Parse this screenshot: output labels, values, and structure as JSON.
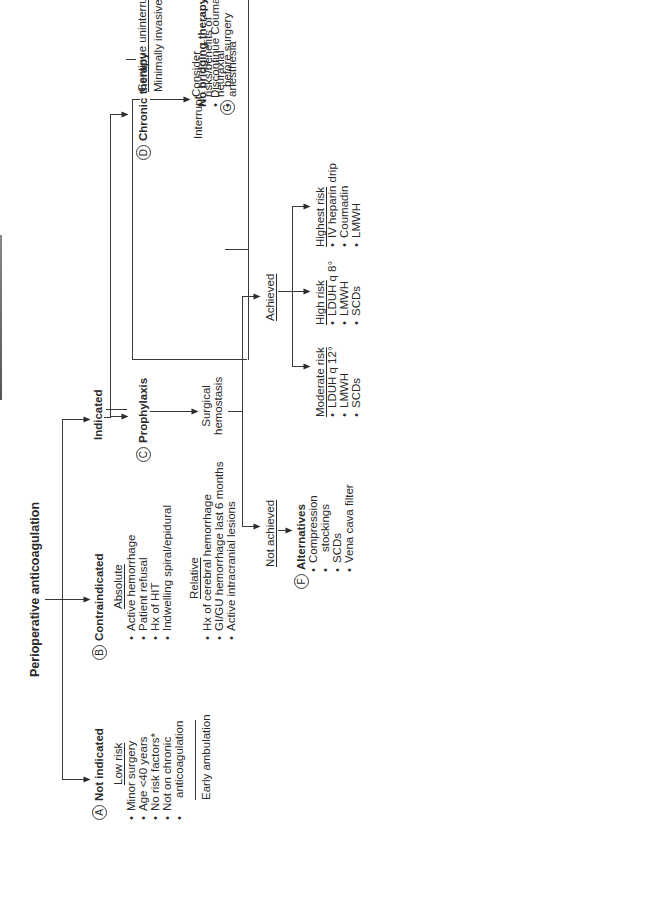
{
  "title": "Perioperative anticoagulation",
  "branches": {
    "not_indicated": {
      "marker": "A",
      "label": "Not indicated",
      "subheading": "Low risk",
      "items": [
        "Minor surgery",
        "Age <40 years",
        "No risk factors*",
        "Not on chronic",
        "anticoagulation"
      ],
      "footer": "Early ambulation"
    },
    "contraindicated": {
      "marker": "B",
      "label": "Contraindicated",
      "absolute": {
        "heading": "Absolute",
        "items": [
          "Active hemorrhage",
          "Patient refusal",
          "Hx of HIT",
          "Indwelling spiral/epidural"
        ]
      },
      "relative": {
        "heading": "Relative",
        "items": [
          "Hx of cerebral hemorrhage",
          "GI/GU hemorrhage last 6 months",
          "Active intracranial lesions"
        ]
      }
    },
    "indicated": {
      "label": "Indicated",
      "prophylaxis": {
        "marker": "C",
        "label": "Prophylaxis",
        "hemostasis_label_1": "Surgical",
        "hemostasis_label_2": "hemostasis",
        "not_achieved": {
          "label": "Not achieved",
          "alternatives": {
            "marker": "F",
            "label": "Alternatives",
            "items": [
              "Compression",
              "stockings",
              "SCDs",
              "Vena cava filter"
            ]
          }
        },
        "achieved": {
          "label": "Achieved",
          "risk_groups": [
            {
              "heading": "Moderate risk",
              "items": [
                "LDUH q 12°",
                "LMWH",
                "SCDs"
              ]
            },
            {
              "heading": "High risk",
              "items": [
                "LDUH q 8°",
                "LMWH",
                "SCDs"
              ]
            },
            {
              "heading": "Highest risk",
              "items": [
                "IV heparin drip",
                "Coumadin",
                "LMWH"
              ]
            }
          ]
        }
      },
      "chronic": {
        "marker": "D",
        "label": "Chronic therapy",
        "continue_label": "Continue uninterrupted",
        "continue_sub": "Minimally invasive procedures",
        "interrupt_label": "Interrupt",
        "no_bridging": {
          "label": "No bridging therapy",
          "items": [
            "Discontinue Coumadin 5 days",
            "before surgery"
          ]
        },
        "bridging": {
          "marker": "E",
          "label": "Bridging therapy",
          "items": [
            "Stop Coumadin 5 days before",
            "surgery (6 if INR goal 2.5–3.5)",
            "Start LMWH 2 days after",
            "discontinuing Coumadin",
            "Check INR 1 day before surgery",
            "1 mg VIT K PO if INR > 1.5",
            "Discontinue LMWH 12–24 hours",
            "before surgery",
            "If IV UH admit 3–4 days before",
            "surgery and discontinue",
            "4 hours pre-op"
          ]
        },
        "hemostasis_label_1": "Surgical",
        "hemostasis_label_2": "hemostasis",
        "achieved": {
          "label": "Achieved",
          "items": [
            "Resume bridging",
            "therapy",
            "Resume Coumadin",
            "therapy",
            "Discontinue bridging therapy",
            "when INR therapeutic"
          ]
        },
        "not_achieved": {
          "label": "Not achieved",
          "marker": "F",
          "alternatives": "Alternatives"
        }
      }
    },
    "neuraxial": {
      "marker": "G",
      "lines": [
        "Consider",
        "risks/benefits of",
        "neuraxial",
        "anesthesia"
      ]
    }
  },
  "dosing_box": {
    "heading": "Dosing regimens",
    "lines": [
      "LMWH prophylaxis:  Lovenox 30 mg sq bid or",
      "40 mg sq qd",
      "LMWH full dose: Lovenox 1 mg/kg q 12 hours",
      "Low dose unfractionated heparin (LDUH): 5000",
      "u sq q 8–12 hours",
      "Unfractionated heparin (UH): intravenous to",
      "therapeutic aPTT"
    ]
  },
  "risk_box": {
    "heading": "*Risk factors for venous thromboembolism",
    "items": [
      "Age > 40 years",
      "Prior history of post-op DVT",
      "Family history of DVT",
      "Venous stasis",
      "CHF",
      "Stroke with paralysis",
      "Spinal cord injury",
      "IBD",
      "Bed immobilization > 12 hours",
      "History idiopathic DVT",
      "Hypercoagulable state",
      "Malignancy",
      "Major surgery"
    ]
  }
}
